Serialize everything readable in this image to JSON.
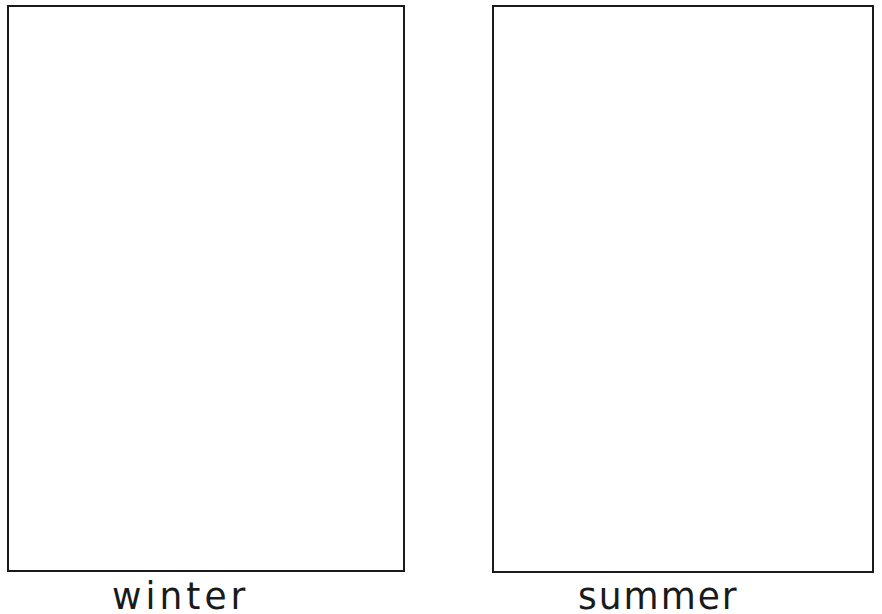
{
  "worksheet": {
    "panels": [
      {
        "label": "winter"
      },
      {
        "label": "summer"
      }
    ]
  }
}
